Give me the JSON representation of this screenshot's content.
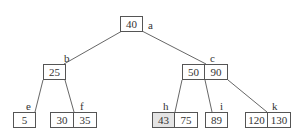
{
  "diagram": {
    "type": "tree",
    "line_color": "#555555",
    "highlight_color": "#e4e4e4",
    "nodes": [
      {
        "id": "a",
        "label": "a",
        "keys": [
          "40"
        ]
      },
      {
        "id": "b",
        "label": "b",
        "keys": [
          "25"
        ]
      },
      {
        "id": "c",
        "label": "c",
        "keys": [
          "50",
          "90"
        ]
      },
      {
        "id": "e",
        "label": "e",
        "keys": [
          "5"
        ]
      },
      {
        "id": "f",
        "label": "f",
        "keys": [
          "30",
          "35"
        ]
      },
      {
        "id": "h",
        "label": "h",
        "keys": [
          "43",
          "75"
        ],
        "highlighted_key": "43"
      },
      {
        "id": "i",
        "label": "i",
        "keys": [
          "89"
        ]
      },
      {
        "id": "k",
        "label": "k",
        "keys": [
          "120",
          "130"
        ]
      }
    ],
    "edges": [
      [
        "a",
        "b"
      ],
      [
        "a",
        "c"
      ],
      [
        "b",
        "e"
      ],
      [
        "b",
        "f"
      ],
      [
        "c",
        "h"
      ],
      [
        "c",
        "i"
      ],
      [
        "c",
        "k"
      ]
    ]
  }
}
